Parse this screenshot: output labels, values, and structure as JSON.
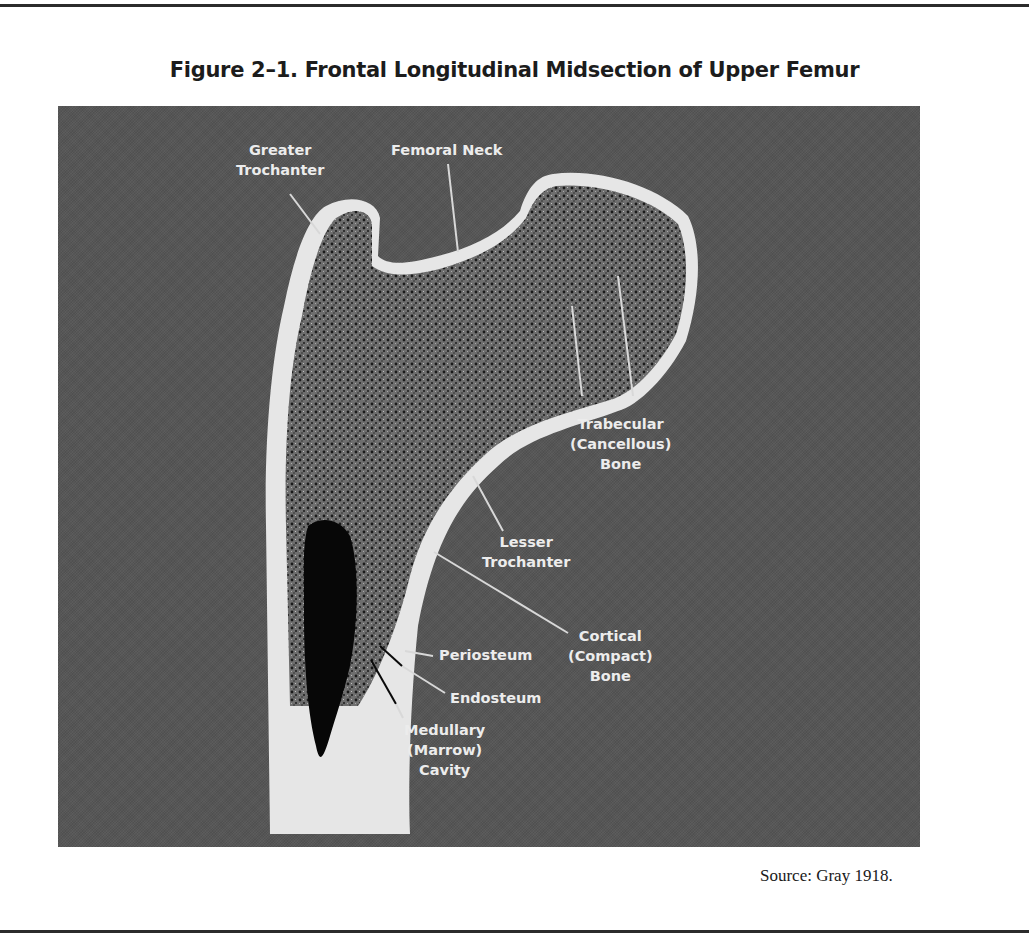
{
  "figure": {
    "title": "Figure 2–1. Frontal Longitudinal Midsection of Upper Femur",
    "source": "Source:  Gray 1918.",
    "background_color": "#555555",
    "bone_color_cortical": "#e8e8e8",
    "bone_color_trabecular": "#3a3a3a",
    "marrow_color": "#080808"
  },
  "labels": {
    "greater_trochanter": {
      "line1": "Greater",
      "line2": "Trochanter"
    },
    "femoral_neck": {
      "line1": "Femoral Neck"
    },
    "trabecular": {
      "line1": "Trabecular",
      "line2": "(Cancellous)",
      "line3": "Bone"
    },
    "lesser_trochanter": {
      "line1": "Lesser",
      "line2": "Trochanter"
    },
    "cortical": {
      "line1": "Cortical",
      "line2": "(Compact)",
      "line3": "Bone"
    },
    "periosteum": {
      "line1": "Periosteum"
    },
    "endosteum": {
      "line1": "Endosteum"
    },
    "medullary": {
      "line1": "Medullary",
      "line2": "(Marrow)",
      "line3": "Cavity"
    }
  }
}
